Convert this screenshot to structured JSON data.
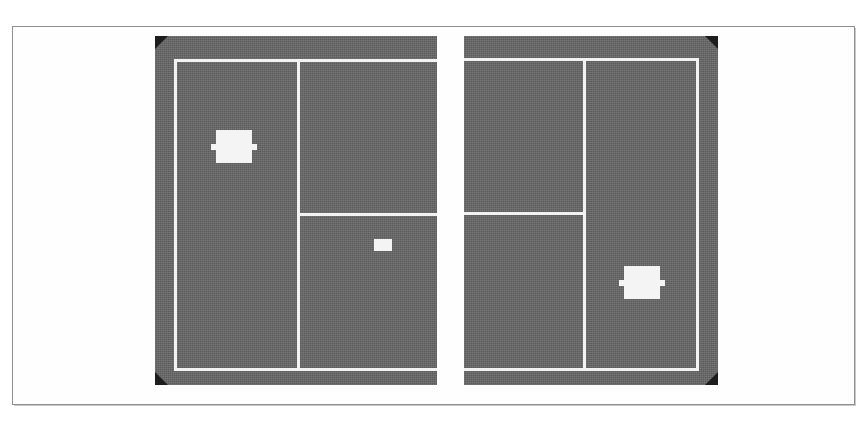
{
  "figure": {
    "kind": "scanned-figure",
    "caption": "",
    "background_color": "#ffffff",
    "frame_color": "#8e8e8e",
    "panel_fill_color": "#666666",
    "line_color": "#f2f2f2",
    "marker_color": "#f4f4f4",
    "corner_mark_color": "#1d1d1d"
  },
  "panels": [
    {
      "id": "left",
      "label": "left-court-panel",
      "rect": {
        "x": 155,
        "y": 36,
        "w": 282,
        "h": 349
      },
      "corner_marks": [
        "top-left",
        "bottom-left"
      ],
      "lines": [
        {
          "name": "outer-baseline-top",
          "orientation": "horizontal",
          "x": 174,
          "y": 59,
          "length": 263
        },
        {
          "name": "outer-sideline-left",
          "orientation": "vertical",
          "x": 174,
          "y": 59,
          "length": 312
        },
        {
          "name": "outer-baseline-bottom",
          "orientation": "horizontal",
          "x": 174,
          "y": 368,
          "length": 263
        },
        {
          "name": "center-divider",
          "orientation": "vertical",
          "x": 297,
          "y": 59,
          "length": 312
        },
        {
          "name": "service-line",
          "orientation": "horizontal",
          "x": 297,
          "y": 213,
          "length": 140
        }
      ],
      "markers": [
        {
          "name": "primary-object-marker",
          "shape": "block-with-side-tabs",
          "x": 216,
          "y": 130,
          "w": 36,
          "h": 33
        },
        {
          "name": "secondary-object-marker",
          "shape": "plain-block",
          "x": 374,
          "y": 239,
          "w": 18,
          "h": 12
        }
      ]
    },
    {
      "id": "right",
      "label": "right-court-panel",
      "rect": {
        "x": 464,
        "y": 36,
        "w": 254,
        "h": 349
      },
      "corner_marks": [
        "top-right",
        "bottom-right"
      ],
      "lines": [
        {
          "name": "outer-baseline-top",
          "orientation": "horizontal",
          "x": 464,
          "y": 58,
          "length": 235
        },
        {
          "name": "outer-sideline-right",
          "orientation": "vertical",
          "x": 696,
          "y": 58,
          "length": 313
        },
        {
          "name": "outer-baseline-bottom",
          "orientation": "horizontal",
          "x": 464,
          "y": 368,
          "length": 235
        },
        {
          "name": "center-divider",
          "orientation": "vertical",
          "x": 583,
          "y": 58,
          "length": 313
        },
        {
          "name": "service-line",
          "orientation": "horizontal",
          "x": 464,
          "y": 212,
          "length": 122
        }
      ],
      "markers": [
        {
          "name": "primary-object-marker",
          "shape": "block-with-side-tabs",
          "x": 624,
          "y": 266,
          "w": 36,
          "h": 33
        }
      ]
    }
  ]
}
